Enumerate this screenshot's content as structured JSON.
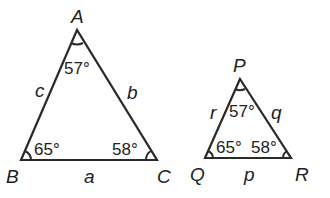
{
  "diagram": {
    "triangle_abc": {
      "vertices": {
        "A": "A",
        "B": "B",
        "C": "C"
      },
      "sides": {
        "a": "a",
        "b": "b",
        "c": "c"
      },
      "angles": {
        "A": "57°",
        "B": "65°",
        "C": "58°"
      }
    },
    "triangle_pqr": {
      "vertices": {
        "P": "P",
        "Q": "Q",
        "R": "R"
      },
      "sides": {
        "p": "p",
        "q": "q",
        "r": "r"
      },
      "angles": {
        "P": "57°",
        "Q": "65°",
        "R": "58°"
      }
    },
    "line_color": "#2a2a2a"
  }
}
